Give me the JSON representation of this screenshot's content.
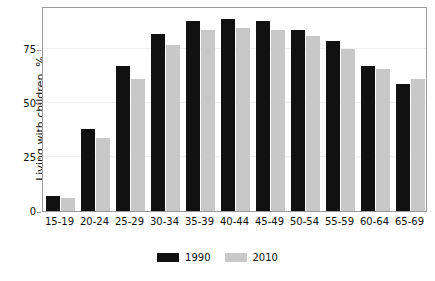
{
  "chart_data": {
    "type": "bar",
    "title": "",
    "xlabel": "",
    "ylabel": "Living with children, %",
    "categories": [
      "15-19",
      "20-24",
      "25-29",
      "30-34",
      "35-39",
      "40-44",
      "45-49",
      "50-54",
      "55-59",
      "60-64",
      "65-69"
    ],
    "series": [
      {
        "name": "1990",
        "color": "#111111",
        "values": [
          7,
          38,
          67,
          82,
          88,
          89,
          88,
          84,
          79,
          67,
          59
        ]
      },
      {
        "name": "2010",
        "color": "#c8c8c8",
        "values": [
          6,
          34,
          61,
          77,
          84,
          85,
          84,
          81,
          75,
          66,
          61
        ]
      }
    ],
    "ylim": [
      0,
      95
    ],
    "yticks": [
      0,
      25,
      50,
      75
    ],
    "ytick_labels": [
      "0",
      "25",
      "50",
      "75"
    ],
    "grid": "horizontal",
    "legend_position": "bottom-center",
    "legend_entries": [
      "1990",
      "2010"
    ]
  }
}
